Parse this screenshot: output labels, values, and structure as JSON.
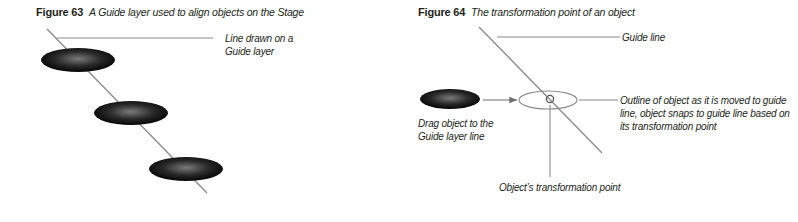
{
  "figure63": {
    "number": "Figure 63",
    "caption": "A Guide layer used to align objects on the Stage",
    "callout_line1": "Line drawn on a",
    "callout_line2": "Guide layer"
  },
  "figure64": {
    "number": "Figure 64",
    "caption": "The transformation point of an object",
    "guide_line_label": "Guide line",
    "drag_label_line1": "Drag object to the",
    "drag_label_line2": "Guide layer line",
    "outline_label_line1": "Outline of object as it is moved to guide",
    "outline_label_line2": "line, object snaps to guide line based on",
    "outline_label_line3": "its transformation point",
    "transformation_point_label": "Object’s transformation point"
  },
  "colors": {
    "line": "#8a8a8a",
    "text": "#231f20",
    "object_dark": "#111111",
    "object_highlight": "#7a7a7a"
  }
}
